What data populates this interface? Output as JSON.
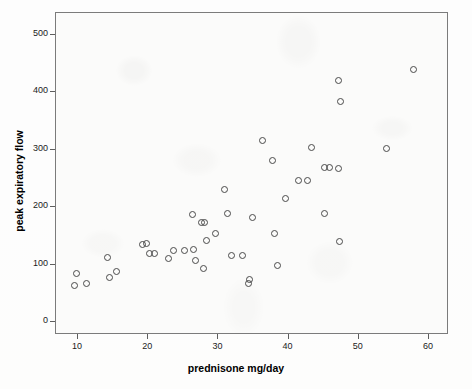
{
  "chart_data": {
    "type": "scatter",
    "title": "",
    "xlabel": "prednisone mg/day",
    "ylabel": "peak expiratory flow",
    "xlim": [
      7,
      63
    ],
    "ylim": [
      -18,
      520
    ],
    "xticks": [
      10,
      20,
      30,
      40,
      50,
      60
    ],
    "yticks": [
      0,
      100,
      200,
      300,
      400,
      500
    ],
    "grid": false,
    "legend": null,
    "marker": "open-circle",
    "marker_color": "#4a4a4a",
    "n_points": 45,
    "x": [
      9.9,
      9.6,
      11.3,
      14.3,
      14.9,
      15.1,
      19.3,
      19.8,
      20.3,
      20.8,
      23.0,
      23.7,
      26.7,
      26.9,
      27.2,
      27.9,
      28.2,
      28.6,
      30.1,
      31.0,
      31.1,
      31.8,
      32.0,
      34.0,
      34.9,
      34.9,
      35.1,
      36.4,
      36.6,
      37.8,
      38.4,
      38.6,
      39.8,
      41.5,
      43.5,
      45.2,
      45.3,
      47.0,
      47.3,
      47.4,
      47.6,
      54.1,
      57.9,
      25.3,
      29.7
    ],
    "y": [
      82,
      62,
      110,
      76,
      86,
      133,
      133,
      135,
      117,
      117,
      108,
      122,
      185,
      125,
      105,
      172,
      172,
      141,
      91,
      187,
      229,
      114,
      187,
      65,
      72,
      65,
      181,
      314,
      314,
      280,
      152,
      97,
      214,
      245,
      303,
      187,
      268,
      419,
      138,
      265,
      382,
      301,
      439,
      122,
      152
    ],
    "points": [
      {
        "x": 9.9,
        "y": 82
      },
      {
        "x": 9.6,
        "y": 62
      },
      {
        "x": 11.3,
        "y": 66
      },
      {
        "x": 14.3,
        "y": 110
      },
      {
        "x": 14.6,
        "y": 76
      },
      {
        "x": 15.6,
        "y": 86
      },
      {
        "x": 19.3,
        "y": 133
      },
      {
        "x": 19.9,
        "y": 135
      },
      {
        "x": 20.3,
        "y": 117
      },
      {
        "x": 23.0,
        "y": 109
      },
      {
        "x": 23.7,
        "y": 122
      },
      {
        "x": 26.4,
        "y": 185
      },
      {
        "x": 26.6,
        "y": 125
      },
      {
        "x": 26.9,
        "y": 105
      },
      {
        "x": 27.7,
        "y": 171
      },
      {
        "x": 28.2,
        "y": 172
      },
      {
        "x": 28.5,
        "y": 141
      },
      {
        "x": 28.0,
        "y": 91
      },
      {
        "x": 31.0,
        "y": 229
      },
      {
        "x": 31.5,
        "y": 187
      },
      {
        "x": 32.0,
        "y": 114
      },
      {
        "x": 34.6,
        "y": 73
      },
      {
        "x": 34.5,
        "y": 65
      },
      {
        "x": 35.0,
        "y": 181
      },
      {
        "x": 36.4,
        "y": 314
      },
      {
        "x": 37.8,
        "y": 280
      },
      {
        "x": 38.2,
        "y": 152
      },
      {
        "x": 38.5,
        "y": 97
      },
      {
        "x": 39.7,
        "y": 214
      },
      {
        "x": 41.5,
        "y": 245
      },
      {
        "x": 43.4,
        "y": 303
      },
      {
        "x": 45.3,
        "y": 187
      },
      {
        "x": 45.2,
        "y": 268
      },
      {
        "x": 47.3,
        "y": 419
      },
      {
        "x": 47.4,
        "y": 138
      },
      {
        "x": 47.2,
        "y": 265
      },
      {
        "x": 47.5,
        "y": 382
      },
      {
        "x": 54.1,
        "y": 301
      },
      {
        "x": 57.9,
        "y": 439
      },
      {
        "x": 25.3,
        "y": 122
      },
      {
        "x": 29.7,
        "y": 152
      },
      {
        "x": 21.0,
        "y": 117
      },
      {
        "x": 33.6,
        "y": 114
      },
      {
        "x": 42.8,
        "y": 245
      },
      {
        "x": 46.0,
        "y": 268
      }
    ]
  },
  "axes": {
    "x_tick_labels": [
      "10",
      "20",
      "30",
      "40",
      "50",
      "60"
    ],
    "y_tick_labels": [
      "0",
      "100",
      "200",
      "300",
      "400",
      "500"
    ],
    "x_axis_title": "prednisone mg/day",
    "y_axis_title": "peak expiratory flow"
  }
}
